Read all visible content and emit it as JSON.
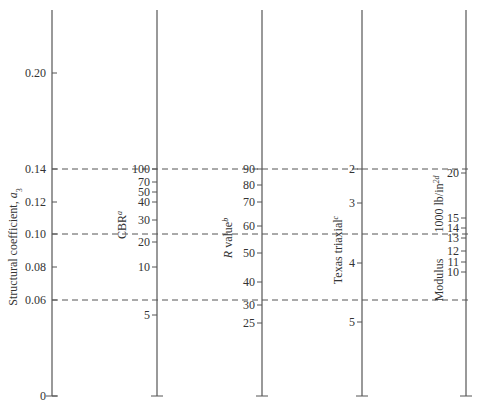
{
  "chart_data": {
    "type": "nomograph",
    "title": "",
    "dashed_reference_lines": [
      {
        "structural_coefficient": 0.14,
        "cbr": 100,
        "r_value": 90,
        "texas_triaxial": 2.0,
        "modulus": 20
      },
      {
        "structural_coefficient": 0.1,
        "cbr": 22,
        "r_value": 56,
        "texas_triaxial": 3.5,
        "modulus": 13.5
      },
      {
        "structural_coefficient": 0.06,
        "cbr": 7,
        "r_value": 32,
        "texas_triaxial": 4.6,
        "modulus": 7
      }
    ],
    "axes": [
      {
        "id": "a3",
        "label": "Structural coefficient, ",
        "label_var": "a",
        "label_sub": "3",
        "x": 52,
        "ticks": [
          {
            "v": "0",
            "y": 396
          },
          {
            "v": "0.06",
            "y": 300
          },
          {
            "v": "0.08",
            "y": 267
          },
          {
            "v": "0.10",
            "y": 234
          },
          {
            "v": "0.12",
            "y": 202
          },
          {
            "v": "0.14",
            "y": 169
          },
          {
            "v": "0.20",
            "y": 73
          }
        ]
      },
      {
        "id": "cbr",
        "label": "CBR",
        "label_sup": "a",
        "x": 157,
        "ticks": [
          {
            "v": "100",
            "y": 169
          },
          {
            "v": "70",
            "y": 182
          },
          {
            "v": "50",
            "y": 192
          },
          {
            "v": "40",
            "y": 202
          },
          {
            "v": "30",
            "y": 220
          },
          {
            "v": "20",
            "y": 242
          },
          {
            "v": "10",
            "y": 267
          },
          {
            "v": "5",
            "y": 315
          }
        ]
      },
      {
        "id": "r",
        "label": " value",
        "label_var": "R",
        "label_sup": "b",
        "x": 262,
        "ticks": [
          {
            "v": "90",
            "y": 169
          },
          {
            "v": "80",
            "y": 185
          },
          {
            "v": "70",
            "y": 202
          },
          {
            "v": "60",
            "y": 226
          },
          {
            "v": "50",
            "y": 253
          },
          {
            "v": "40",
            "y": 282
          },
          {
            "v": "30",
            "y": 305
          },
          {
            "v": "25",
            "y": 323
          }
        ]
      },
      {
        "id": "texas",
        "label": "Texas triaxial",
        "label_sup": "c",
        "x": 362,
        "ticks": [
          {
            "v": "2",
            "y": 169
          },
          {
            "v": "3",
            "y": 203
          },
          {
            "v": "4",
            "y": 263
          },
          {
            "v": "5",
            "y": 322
          }
        ]
      },
      {
        "id": "modulus",
        "label_top": "1000 lb/in",
        "label_top_sup": "2d",
        "label_bottom": "Modulus",
        "x": 466,
        "ticks": [
          {
            "v": "20",
            "y": 173
          },
          {
            "v": "15",
            "y": 218
          },
          {
            "v": "14",
            "y": 228
          },
          {
            "v": "13",
            "y": 238
          },
          {
            "v": "12",
            "y": 251
          },
          {
            "v": "11",
            "y": 262
          },
          {
            "v": "10",
            "y": 272
          }
        ]
      }
    ],
    "axis_top_y": 10,
    "axis_bottom_y": 396
  }
}
